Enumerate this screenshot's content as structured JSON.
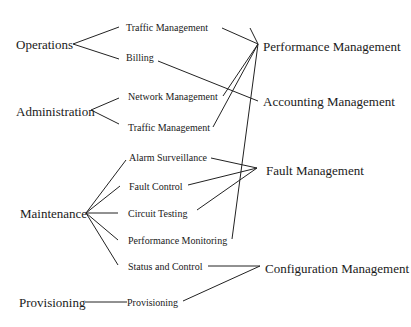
{
  "diagram": {
    "sources": [
      {
        "id": "operations",
        "label": "Operations"
      },
      {
        "id": "administration",
        "label": "Administration"
      },
      {
        "id": "maintenance",
        "label": "Maintenance"
      },
      {
        "id": "provisioning",
        "label": "Provisioning"
      }
    ],
    "functions": [
      {
        "id": "traffic1",
        "label": "Traffic Management",
        "source": "operations",
        "target": "performance"
      },
      {
        "id": "billing",
        "label": "Billing",
        "source": "operations",
        "target": "accounting"
      },
      {
        "id": "network",
        "label": "Network Management",
        "source": "administration",
        "target": "performance"
      },
      {
        "id": "traffic2",
        "label": "Traffic Management",
        "source": "administration",
        "target": "performance"
      },
      {
        "id": "alarm",
        "label": "Alarm Surveillance",
        "source": "maintenance",
        "target": "fault"
      },
      {
        "id": "faultctl",
        "label": "Fault Control",
        "source": "maintenance",
        "target": "fault"
      },
      {
        "id": "circuit",
        "label": "Circuit Testing",
        "source": "maintenance",
        "target": "fault"
      },
      {
        "id": "perfmon",
        "label": "Performance Monitoring",
        "source": "maintenance",
        "target": "performance"
      },
      {
        "id": "status",
        "label": "Status and Control",
        "source": "maintenance",
        "target": "configuration"
      },
      {
        "id": "prov",
        "label": "Provisioning",
        "source": "provisioning",
        "target": "configuration"
      }
    ],
    "targets": [
      {
        "id": "performance",
        "label": "Performance Management"
      },
      {
        "id": "accounting",
        "label": "Accounting Management"
      },
      {
        "id": "fault",
        "label": "Fault Management"
      },
      {
        "id": "configuration",
        "label": "Configuration Management"
      }
    ]
  }
}
